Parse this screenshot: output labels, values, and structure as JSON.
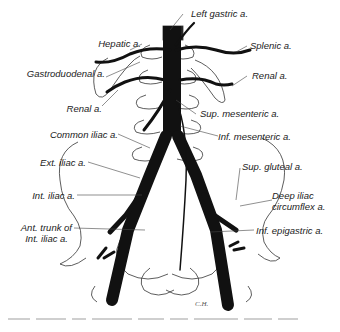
{
  "figure": {
    "colors": {
      "artery": "#111111",
      "outline": "#333333",
      "background": "#ffffff"
    },
    "labels": {
      "left_gastric": "Left gastric a.",
      "hepatic": "Hepatic a.",
      "splenic": "Splenic a.",
      "gastroduodenal": "Gastroduodenal a.",
      "renal_right": "Renal a.",
      "renal_left": "Renal a.",
      "sup_mesenteric": "Sup. mesenteric a.",
      "common_iliac": "Common iliac a.",
      "inf_mesenteric": "Inf. mesenteric a.",
      "ext_iliac": "Ext. iliac a.",
      "sup_gluteal": "Sup. gluteal a.",
      "int_iliac": "Int. iliac a.",
      "deep_iliac_circumflex_1": "Deep iliac",
      "deep_iliac_circumflex_2": "circumflex a.",
      "ant_trunk_1": "Ant. trunk of",
      "ant_trunk_2": "Int. iliac a.",
      "inf_epigastric": "Inf. epigastric a."
    },
    "signature": "C.H."
  }
}
